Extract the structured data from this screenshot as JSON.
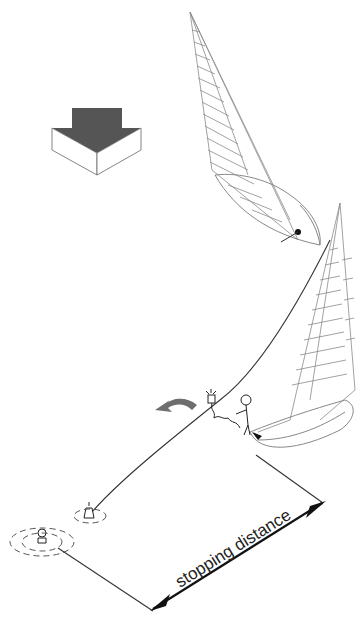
{
  "diagram": {
    "labels": {
      "stopping_distance": "stopping distance"
    },
    "elements": {
      "wind_arrow": "wind-direction-arrow",
      "boat_1": "sailboat-initial-position",
      "boat_2": "sailboat-after-turn",
      "person_overboard": "person-in-water",
      "buoy": "lifebuoy-with-light",
      "crew": "crew-member-on-deck",
      "turn_arrow": "turn-direction-arrow"
    },
    "colors": {
      "wind_arrow_dark": "#555555",
      "turn_arrow": "#6e6e6e",
      "line": "#333333",
      "sail_stroke": "#8a8a8a"
    }
  }
}
